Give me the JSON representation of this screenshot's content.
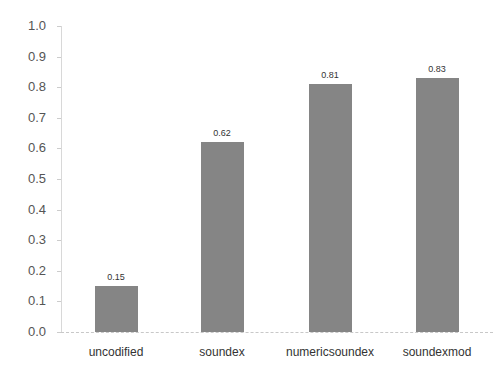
{
  "chart_data": {
    "type": "bar",
    "title": "",
    "xlabel": "",
    "ylabel": "",
    "categories": [
      "uncodified",
      "soundex",
      "numericsoundex",
      "soundexmod"
    ],
    "values": [
      0.15,
      0.62,
      0.81,
      0.83
    ],
    "value_labels": [
      "0.15",
      "0.62",
      "0.81",
      "0.83"
    ],
    "ylim": [
      0.0,
      1.0
    ],
    "yticks": [
      "0.0",
      "0.1",
      "0.2",
      "0.3",
      "0.4",
      "0.5",
      "0.6",
      "0.7",
      "0.8",
      "0.9",
      "1.0"
    ],
    "grid": false,
    "legend": null,
    "bar_color": "#858585"
  }
}
